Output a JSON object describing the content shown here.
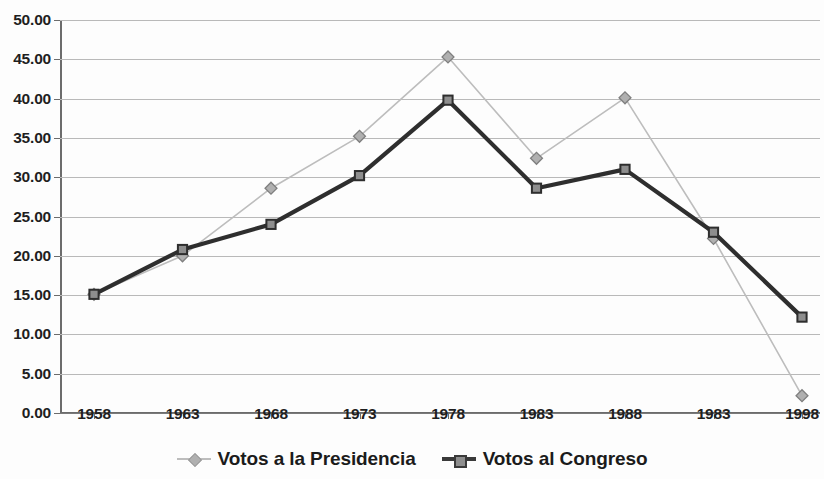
{
  "chart_data": {
    "type": "line",
    "title": "",
    "xlabel": "",
    "ylabel": "",
    "ylim": [
      0,
      50
    ],
    "ytick_step": 5,
    "grid": true,
    "legend_position": "bottom",
    "categories": [
      "1958",
      "1963",
      "1968",
      "1973",
      "1978",
      "1983",
      "1988",
      "1983",
      "1998"
    ],
    "ytick_labels": [
      "0.00",
      "5.00",
      "10.00",
      "15.00",
      "20.00",
      "25.00",
      "30.00",
      "35.00",
      "40.00",
      "45.00",
      "50.00"
    ],
    "ytick_values": [
      0,
      5,
      10,
      15,
      20,
      25,
      30,
      35,
      40,
      45,
      50
    ],
    "series": [
      {
        "name": "Votos a la Presidencia",
        "marker": "diamond",
        "color": "#b0b0b0",
        "line_color": "#bdbdbd",
        "line_width": 1.6,
        "values": [
          15.1,
          20.0,
          28.6,
          35.2,
          45.3,
          32.4,
          40.1,
          22.2,
          2.2
        ]
      },
      {
        "name": "Votos al Congreso",
        "marker": "square",
        "color": "#8e8e8e",
        "line_color": "#2e2e2e",
        "line_width": 4.2,
        "values": [
          15.1,
          20.8,
          24.0,
          30.2,
          39.8,
          28.6,
          31.0,
          23.0,
          12.2
        ]
      }
    ]
  },
  "legend": {
    "entries": [
      {
        "label": "Votos a la Presidencia"
      },
      {
        "label": "Votos al Congreso"
      }
    ]
  },
  "title_sliver": ""
}
